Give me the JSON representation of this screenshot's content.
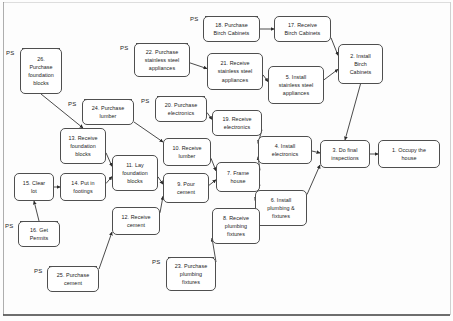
{
  "document": {
    "title": "House construction precedence network diagram",
    "type": "activity-on-node network diagram",
    "ps_tag_label": "PS",
    "ps_tag_meaning": "project start"
  },
  "nodes": [
    {
      "id": "n1",
      "number": "1.",
      "label": "1. Occupy the\nhouse",
      "lines": [
        "1. Occupy the",
        "house"
      ],
      "ps": false,
      "x": 378,
      "y": 140,
      "w": 62,
      "h": 28
    },
    {
      "id": "n2",
      "number": "2.",
      "label": "2. Install\nBirch\nCabinets",
      "lines": [
        "2. Install",
        "Birch",
        "Cabinets"
      ],
      "ps": false,
      "x": 338,
      "y": 44,
      "w": 45,
      "h": 40
    },
    {
      "id": "n3",
      "number": "3.",
      "label": "3. Do final\ninspections",
      "lines": [
        "3. Do final",
        "inspections"
      ],
      "ps": false,
      "x": 320,
      "y": 140,
      "w": 50,
      "h": 28
    },
    {
      "id": "n4",
      "number": "4.",
      "label": "4. Install\nelectronics",
      "lines": [
        "4. Install",
        "electronics"
      ],
      "ps": false,
      "x": 258,
      "y": 136,
      "w": 54,
      "h": 28
    },
    {
      "id": "n5",
      "number": "5.",
      "label": "5. Install\nstainless steel\nappliances",
      "lines": [
        "5. Install",
        "stainless steel",
        "appliances"
      ],
      "ps": false,
      "x": 268,
      "y": 66,
      "w": 56,
      "h": 38
    },
    {
      "id": "n6",
      "number": "6.",
      "label": "6. Install\nplumbing  &\nfixtures",
      "lines": [
        "6. Install",
        "plumbing  &",
        "fixtures"
      ],
      "ps": false,
      "x": 255,
      "y": 190,
      "w": 52,
      "h": 36
    },
    {
      "id": "n7",
      "number": "7.",
      "label": "7. Frame\nhouse",
      "lines": [
        "7. Frame",
        "house"
      ],
      "ps": false,
      "x": 216,
      "y": 162,
      "w": 44,
      "h": 30
    },
    {
      "id": "n8",
      "number": "8.",
      "label": "8. Receive\nplumbing\nfixtures",
      "lines": [
        "8. Receive",
        "plumbing",
        "fixtures"
      ],
      "ps": false,
      "x": 212,
      "y": 208,
      "w": 48,
      "h": 36
    },
    {
      "id": "n9",
      "number": "9.",
      "label": "9. Pour\ncement",
      "lines": [
        "9. Pour",
        "cement"
      ],
      "ps": false,
      "x": 163,
      "y": 173,
      "w": 46,
      "h": 30
    },
    {
      "id": "n10",
      "number": "10.",
      "label": "10. Receive\nlumber",
      "lines": [
        "10. Receive",
        "lumber"
      ],
      "ps": false,
      "x": 163,
      "y": 138,
      "w": 48,
      "h": 28
    },
    {
      "id": "n11",
      "number": "11.",
      "label": "11. Lay\nfoundation\nblocks",
      "lines": [
        "11. Lay",
        "foundation",
        "blocks"
      ],
      "ps": false,
      "x": 112,
      "y": 155,
      "w": 46,
      "h": 36
    },
    {
      "id": "n12",
      "number": "12.",
      "label": "12. Receive\ncement",
      "lines": [
        "12. Receive",
        "cement"
      ],
      "ps": false,
      "x": 112,
      "y": 207,
      "w": 48,
      "h": 28
    },
    {
      "id": "n13",
      "number": "13.",
      "label": "13. Receive\nfoundation\nblocks",
      "lines": [
        "13. Receive",
        "foundation",
        "blocks"
      ],
      "ps": false,
      "x": 60,
      "y": 128,
      "w": 46,
      "h": 36
    },
    {
      "id": "n14",
      "number": "14.",
      "label": "14. Put in\nfootings",
      "lines": [
        "14. Put in",
        "footings"
      ],
      "ps": false,
      "x": 60,
      "y": 173,
      "w": 46,
      "h": 28
    },
    {
      "id": "n15",
      "number": "15.",
      "label": "15. Clear\nlot",
      "lines": [
        "15. Clear",
        "lot"
      ],
      "ps": false,
      "x": 14,
      "y": 173,
      "w": 40,
      "h": 28
    },
    {
      "id": "n16",
      "number": "16.",
      "label": "16. Get\nPermits",
      "lines": [
        "16. Get",
        "Permits"
      ],
      "ps": true,
      "x": 18,
      "y": 221,
      "w": 42,
      "h": 26
    },
    {
      "id": "n17",
      "number": "17.",
      "label": "17. Receive\nBirch Cabinets",
      "lines": [
        "17. Receive",
        "Birch Cabinets"
      ],
      "ps": false,
      "x": 274,
      "y": 16,
      "w": 57,
      "h": 26
    },
    {
      "id": "n18",
      "number": "18.",
      "label": "18. Purchase\nBirch Cabinets",
      "lines": [
        "18. Purchase",
        "Birch Cabinets"
      ],
      "ps": true,
      "x": 203,
      "y": 16,
      "w": 57,
      "h": 26
    },
    {
      "id": "n19",
      "number": "19.",
      "label": "19. Receive\nelectronics",
      "lines": [
        "19. Receive",
        "electronics"
      ],
      "ps": false,
      "x": 212,
      "y": 110,
      "w": 50,
      "h": 26
    },
    {
      "id": "n20",
      "number": "20.",
      "label": "20. Purchase\nelectronics",
      "lines": [
        "20. Purchase",
        "electronics"
      ],
      "ps": true,
      "x": 155,
      "y": 96,
      "w": 52,
      "h": 26
    },
    {
      "id": "n21",
      "number": "21.",
      "label": "21. Receive\nstainless steel\nappliances",
      "lines": [
        "21. Receive",
        "stainless steel",
        "appliances"
      ],
      "ps": false,
      "x": 207,
      "y": 53,
      "w": 56,
      "h": 37
    },
    {
      "id": "n22",
      "number": "22.",
      "label": "22. Purchase\nstainless steel\nappliances",
      "lines": [
        "22. Purchase",
        "stainless steel",
        "appliances"
      ],
      "ps": true,
      "x": 134,
      "y": 43,
      "w": 56,
      "h": 34
    },
    {
      "id": "n23",
      "number": "23.",
      "label": "23. Purchase\nplumbing\nfixtures",
      "lines": [
        "23. Purchase",
        "plumbing",
        "fixtures"
      ],
      "ps": true,
      "x": 166,
      "y": 257,
      "w": 50,
      "h": 34
    },
    {
      "id": "n24",
      "number": "24.",
      "label": "24. Purchase\nlumber",
      "lines": [
        "24. Purchase",
        "lumber"
      ],
      "ps": true,
      "x": 82,
      "y": 99,
      "w": 52,
      "h": 26
    },
    {
      "id": "n25",
      "number": "25.",
      "label": "25. Purchase\ncement",
      "lines": [
        "25. Purchase",
        "cement"
      ],
      "ps": true,
      "x": 47,
      "y": 266,
      "w": 52,
      "h": 26
    },
    {
      "id": "n26",
      "number": "26.",
      "label": "26.\nPurchase\nfoundation\nblocks",
      "lines": [
        "26.",
        "Purchase",
        "foundation",
        "blocks"
      ],
      "ps": true,
      "x": 20,
      "y": 48,
      "w": 42,
      "h": 46
    }
  ],
  "ps_tags": [
    {
      "for": "n26",
      "x": 6,
      "y": 50
    },
    {
      "for": "n22",
      "x": 120,
      "y": 45
    },
    {
      "for": "n18",
      "x": 190,
      "y": 16
    },
    {
      "for": "n20",
      "x": 141,
      "y": 98
    },
    {
      "for": "n24",
      "x": 68,
      "y": 101
    },
    {
      "for": "n16",
      "x": 5,
      "y": 223
    },
    {
      "for": "n25",
      "x": 34,
      "y": 268
    },
    {
      "for": "n23",
      "x": 152,
      "y": 259
    }
  ],
  "edges": [
    {
      "from": "n26",
      "to": "n13"
    },
    {
      "from": "n13",
      "to": "n11"
    },
    {
      "from": "n15",
      "to": "n14"
    },
    {
      "from": "n16",
      "to": "n15"
    },
    {
      "from": "n14",
      "to": "n11"
    },
    {
      "from": "n25",
      "to": "n12"
    },
    {
      "from": "n12",
      "to": "n9"
    },
    {
      "from": "n11",
      "to": "n9"
    },
    {
      "from": "n24",
      "to": "n10"
    },
    {
      "from": "n10",
      "to": "n7"
    },
    {
      "from": "n9",
      "to": "n7"
    },
    {
      "from": "n7",
      "to": "n4"
    },
    {
      "from": "n7",
      "to": "n6"
    },
    {
      "from": "n23",
      "to": "n8"
    },
    {
      "from": "n8",
      "to": "n6"
    },
    {
      "from": "n20",
      "to": "n19"
    },
    {
      "from": "n19",
      "to": "n4"
    },
    {
      "from": "n22",
      "to": "n21"
    },
    {
      "from": "n21",
      "to": "n5"
    },
    {
      "from": "n18",
      "to": "n17"
    },
    {
      "from": "n17",
      "to": "n2"
    },
    {
      "from": "n5",
      "to": "n2"
    },
    {
      "from": "n2",
      "to": "n3"
    },
    {
      "from": "n4",
      "to": "n3"
    },
    {
      "from": "n6",
      "to": "n3"
    },
    {
      "from": "n3",
      "to": "n1"
    }
  ],
  "colors": {
    "node_border": "#4f4f4f",
    "node_fill": "#ffffff",
    "edge": "#2b2b2b",
    "text": "#1b1b1b",
    "page_background": "#fdfdfd",
    "frame_rule": "#4a4a4a"
  }
}
